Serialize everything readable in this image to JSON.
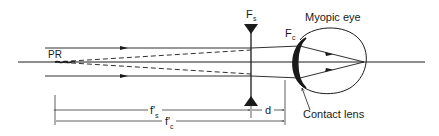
{
  "diagram": {
    "labels": {
      "far_point": "PR",
      "spectacle_focal_point": "F",
      "spectacle_sub": "s",
      "contact_focal_point": "F",
      "contact_sub": "c",
      "eye": "Myopic eye",
      "contact_lens": "Contact lens",
      "vertex_distance": "d",
      "spectacle_focal_length": "f'",
      "spectacle_focal_length_sub": "s",
      "contact_focal_length": "f'",
      "contact_focal_length_sub": "c"
    },
    "colors": {
      "line": "#1a1a1a",
      "background": "#ffffff"
    }
  }
}
